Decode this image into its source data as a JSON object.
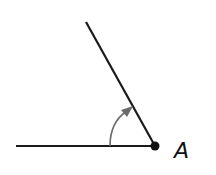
{
  "diagram": {
    "type": "angle",
    "vertex_label": "A",
    "colors": {
      "rays": "#1a1a1a",
      "arc": "#6b6b6b",
      "vertex": "#111111"
    },
    "vertex": {
      "x": 155,
      "y": 146
    },
    "initial_ray_end": {
      "x": 16,
      "y": 146
    },
    "terminal_ray_end": {
      "x": 86,
      "y": 22
    },
    "rotation_arrow": "counterclockwise-arc-icon"
  }
}
